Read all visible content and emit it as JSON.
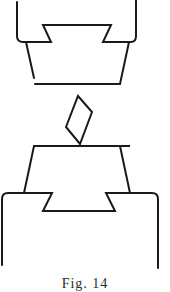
{
  "figure": {
    "stroke_color": "#1a1a1a",
    "background": "#ffffff",
    "parts": [
      {
        "name": "upper-block",
        "label": ""
      },
      {
        "name": "diamond-key",
        "label": ""
      },
      {
        "name": "lower-block",
        "label": ""
      }
    ]
  },
  "caption": {
    "text": "Fig. 14"
  }
}
